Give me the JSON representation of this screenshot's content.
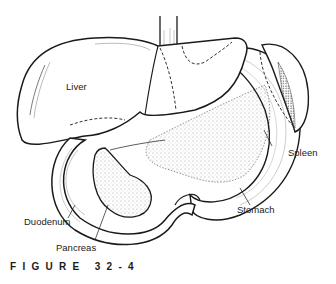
{
  "figure": {
    "caption": "FIGURE 32-4",
    "labels": {
      "liver": "Liver",
      "spleen": "Spleen",
      "stomach": "Stomach",
      "duodenum": "Duodenum",
      "pancreas": "Pancreas"
    }
  },
  "colors": {
    "ink": "#1a1a1a",
    "background": "#ffffff",
    "stipple": "#555555"
  }
}
